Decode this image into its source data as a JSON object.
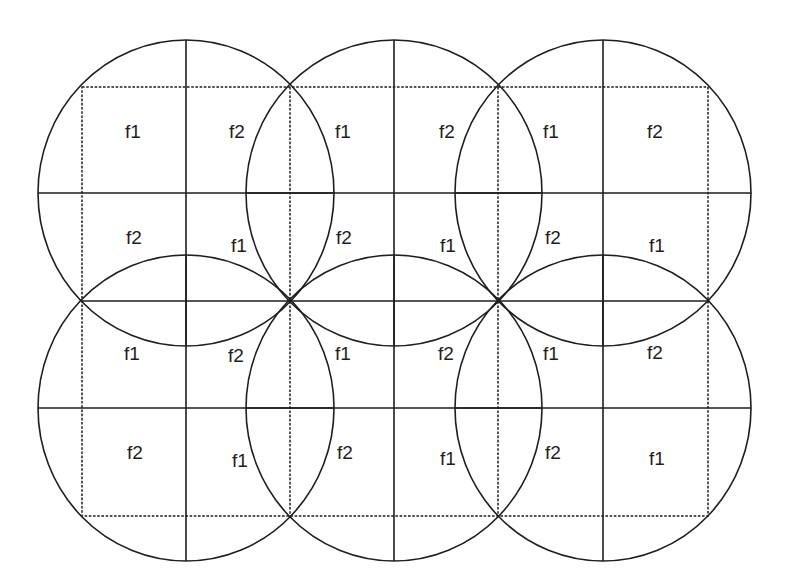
{
  "diagram": {
    "title": "",
    "stroke_color": "#1e1e1e",
    "background": "#ffffff",
    "cells": {
      "radius_x": 148,
      "radius_y": 153,
      "centers": [
        {
          "id": "cell-top-1",
          "cx": 186,
          "cy": 193
        },
        {
          "id": "cell-top-2",
          "cx": 394,
          "cy": 193
        },
        {
          "id": "cell-top-3",
          "cx": 603,
          "cy": 193
        },
        {
          "id": "cell-bottom-1",
          "cx": 186,
          "cy": 408
        },
        {
          "id": "cell-bottom-2",
          "cx": 394,
          "cy": 408
        },
        {
          "id": "cell-bottom-3",
          "cx": 603,
          "cy": 408
        }
      ]
    },
    "grid": {
      "dashed_rect": {
        "x1": 82,
        "y1": 87,
        "x2": 708,
        "y2": 516
      },
      "dashed_verticals": [
        290,
        498
      ],
      "middle_solid_y": 301
    },
    "labels": [
      {
        "text": "f1",
        "x": 133,
        "y": 131
      },
      {
        "text": "f2",
        "x": 237,
        "y": 131
      },
      {
        "text": "f1",
        "x": 343,
        "y": 131
      },
      {
        "text": "f2",
        "x": 447,
        "y": 131
      },
      {
        "text": "f1",
        "x": 551,
        "y": 131
      },
      {
        "text": "f2",
        "x": 655,
        "y": 131
      },
      {
        "text": "f2",
        "x": 134,
        "y": 237
      },
      {
        "text": "f1",
        "x": 239,
        "y": 245
      },
      {
        "text": "f2",
        "x": 344,
        "y": 237
      },
      {
        "text": "f1",
        "x": 448,
        "y": 245
      },
      {
        "text": "f2",
        "x": 553,
        "y": 237
      },
      {
        "text": "f1",
        "x": 657,
        "y": 245
      },
      {
        "text": "f1",
        "x": 132,
        "y": 353
      },
      {
        "text": "f2",
        "x": 236,
        "y": 355
      },
      {
        "text": "f1",
        "x": 343,
        "y": 353
      },
      {
        "text": "f2",
        "x": 446,
        "y": 353
      },
      {
        "text": "f1",
        "x": 551,
        "y": 353
      },
      {
        "text": "f2",
        "x": 655,
        "y": 352
      },
      {
        "text": "f2",
        "x": 135,
        "y": 452
      },
      {
        "text": "f1",
        "x": 240,
        "y": 460
      },
      {
        "text": "f2",
        "x": 345,
        "y": 452
      },
      {
        "text": "f1",
        "x": 448,
        "y": 458
      },
      {
        "text": "f2",
        "x": 553,
        "y": 452
      },
      {
        "text": "f1",
        "x": 657,
        "y": 458
      }
    ]
  }
}
